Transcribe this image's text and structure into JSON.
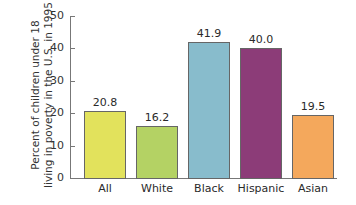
{
  "chart_data": {
    "type": "bar",
    "title": "",
    "xlabel": "",
    "ylabel": "Percent of children under 18 living in poverty in the U.S. in 1995",
    "ylabel_lines": [
      "Percent of children under 18",
      "living in poverty in the U.S. in 1995"
    ],
    "categories": [
      "All",
      "White",
      "Black",
      "Hispanic",
      "Asian"
    ],
    "values": [
      20.8,
      16.2,
      41.9,
      40.0,
      19.5
    ],
    "value_labels": [
      "20.8",
      "16.2",
      "41.9",
      "40.0",
      "19.5"
    ],
    "colors": [
      "#e2e25c",
      "#b4d264",
      "#88bccc",
      "#8c3c78",
      "#f4a85c"
    ],
    "ylim": [
      0,
      50
    ],
    "yticks": [
      0,
      10,
      20,
      30,
      40,
      50
    ],
    "grid": false,
    "legend": null
  }
}
